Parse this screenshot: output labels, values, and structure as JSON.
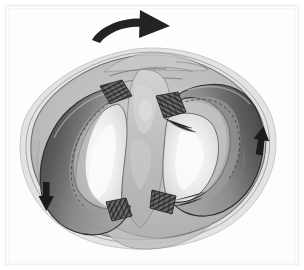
{
  "figure": {
    "title": "",
    "caption": "",
    "view": "superior-view-tibial-plateau",
    "background_color": "#ffffff",
    "frame_color": "#f2f2f2",
    "frame_inner_color": "#fafafa"
  },
  "palette": {
    "outline_dark": "#2b2b2b",
    "outline_mid": "#555555",
    "outline_light": "#8a8a8a",
    "arrow_black": "#1c1c1c",
    "meniscus_outer_dark": "#4f4f4f",
    "meniscus_body_mid": "#8d8d8d",
    "meniscus_highlight": "#a8a8a8",
    "plateau_gray": "#b9b9b9",
    "plateau_gray_light": "#c9c9c9",
    "capsule_translucent": "#cfcfcf",
    "articular_white": "#f1f1f1",
    "articular_offwhite": "#e2e2e2",
    "eminence_gray": "#bdbdbd",
    "attachment_stripe": "#3a3a3a",
    "shadow_gray": "#9a9a9a"
  },
  "annotations": {
    "rotation_arrow": {
      "name": "rotation-arrow",
      "label": "",
      "direction": "clockwise-right",
      "color": "#1c1c1c",
      "position": "top-center"
    },
    "left_meniscus_arrow": {
      "name": "left-meniscus-arrow",
      "label": "",
      "direction": "down",
      "color": "#1c1c1c",
      "position": "left-lower"
    },
    "right_meniscus_arrow": {
      "name": "right-meniscus-arrow",
      "label": "",
      "direction": "up",
      "color": "#1c1c1c",
      "position": "right-middle"
    }
  },
  "structures": {
    "plateau": {
      "name": "tibial-plateau",
      "label": ""
    },
    "left_meniscus": {
      "name": "left-meniscus",
      "label": "",
      "shape": "c-shape-open-right"
    },
    "right_meniscus": {
      "name": "right-meniscus",
      "label": "",
      "shape": "c-shape-open-left"
    },
    "left_articular_surface": {
      "name": "left-articular-surface",
      "label": ""
    },
    "right_articular_surface": {
      "name": "right-articular-surface",
      "label": ""
    },
    "intercondylar_eminence": {
      "name": "intercondylar-eminence",
      "label": ""
    },
    "attachments": [
      {
        "name": "anterior-horn-attachment-left",
        "label": ""
      },
      {
        "name": "anterior-horn-attachment-right",
        "label": ""
      },
      {
        "name": "posterior-horn-attachment-left",
        "label": ""
      },
      {
        "name": "posterior-horn-attachment-right",
        "label": ""
      }
    ]
  }
}
